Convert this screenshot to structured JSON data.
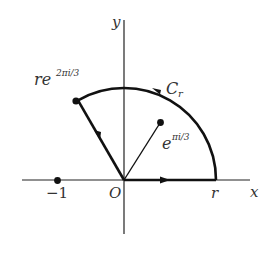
{
  "diagram": {
    "type": "complex-plane contour",
    "axes": {
      "x_label": "x",
      "y_label": "y",
      "origin_label": "O"
    },
    "points": {
      "minus_one": {
        "label": "−1"
      },
      "r": {
        "label": "r"
      },
      "apex": {
        "label_base": "re",
        "label_exp": "2πi/3"
      },
      "pi_over_3": {
        "label_base": "e",
        "label_exp": "πi/3"
      }
    },
    "contour": {
      "label": "C",
      "label_sub": "r"
    },
    "colors": {
      "ink": "#111111",
      "text": "#333333",
      "background": "#ffffff"
    }
  }
}
